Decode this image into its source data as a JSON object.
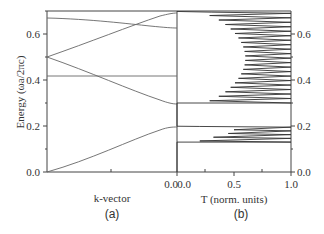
{
  "chart_data": [
    {
      "panel": "(a)",
      "type": "line",
      "title": "",
      "xlabel": "k-vector",
      "ylabel": "Energy (ωa/2πc)",
      "ylim": [
        0.0,
        0.7
      ],
      "yticks": [
        0.0,
        0.2,
        0.4,
        0.6
      ],
      "xticks": [
        "0.0"
      ],
      "x_range": [
        0,
        1
      ],
      "grid": false,
      "series": [
        {
          "name": "band-1",
          "x": [
            0,
            0.2,
            0.4,
            0.6,
            0.8,
            0.9,
            1.0
          ],
          "values": [
            0.0,
            0.045,
            0.09,
            0.135,
            0.175,
            0.19,
            0.195
          ]
        },
        {
          "name": "band-2",
          "x": [
            0,
            0.2,
            0.4,
            0.6,
            0.8,
            0.9,
            1.0
          ],
          "values": [
            0.5,
            0.455,
            0.41,
            0.365,
            0.32,
            0.302,
            0.295
          ]
        },
        {
          "name": "band-flat",
          "x": [
            0,
            1.0
          ],
          "values": [
            0.415,
            0.415
          ]
        },
        {
          "name": "band-3",
          "x": [
            0,
            0.2,
            0.4,
            0.6,
            0.8,
            0.9,
            1.0
          ],
          "values": [
            0.5,
            0.545,
            0.59,
            0.635,
            0.67,
            0.685,
            0.69
          ]
        },
        {
          "name": "band-4",
          "x": [
            0,
            0.2,
            0.4,
            0.6,
            0.8,
            1.0
          ],
          "values": [
            0.675,
            0.672,
            0.662,
            0.648,
            0.637,
            0.632
          ]
        }
      ]
    },
    {
      "panel": "(b)",
      "type": "line",
      "title": "",
      "xlabel": "T (norm. units)",
      "ylabel": "",
      "xlim": [
        0.0,
        1.0
      ],
      "ylim": [
        0.0,
        0.7
      ],
      "xticks": [
        0.0,
        0.5,
        1.0
      ],
      "yticks": [
        0.0,
        0.2,
        0.4,
        0.6
      ],
      "yaxis_position": "right",
      "grid": false,
      "description": "Transmission spectrum vs energy; oscillating Fabry-Perot peaks reaching T=1 inside pass bands (0.13-0.195 and 0.30-0.69), zero in gaps",
      "lower_band": {
        "energy_range": [
          0.13,
          0.195
        ],
        "peak_count": 5,
        "minima_T": [
          0.55,
          0.5,
          0.45,
          0.32,
          0.2
        ]
      },
      "upper_band": {
        "energy_range": [
          0.3,
          0.69
        ],
        "peak_count": 21,
        "minima_T_edge": 0.2,
        "minima_T_center": 0.6
      }
    }
  ],
  "labels": {
    "ylabel_left": "Energy (ωa/2πc)",
    "xlabel_left": "k-vector",
    "xlabel_right": "T (norm. units)",
    "panel_a": "(a)",
    "panel_b": "(b)",
    "ytick_0": "0.0",
    "ytick_1": "0.2",
    "ytick_2": "0.4",
    "ytick_3": "0.6",
    "xtick_a0": "0.0",
    "xtick_b0": "0.0",
    "xtick_b1": "0.5",
    "xtick_b2": "1.0"
  },
  "colors": {
    "line": "#555555",
    "axis": "#444444",
    "text": "#333333"
  }
}
